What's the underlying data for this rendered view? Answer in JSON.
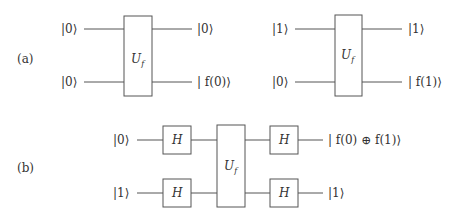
{
  "figure": {
    "parts": [
      {
        "label": "(a)",
        "circuits": [
          {
            "inputs": [
              "|0⟩",
              "|0⟩"
            ],
            "gate": {
              "symbol": "U",
              "subscript": "f"
            },
            "outputs": [
              "|0⟩",
              "| f(0)⟩"
            ]
          },
          {
            "inputs": [
              "|1⟩",
              "|0⟩"
            ],
            "gate": {
              "symbol": "U",
              "subscript": "f"
            },
            "outputs": [
              "|1⟩",
              "| f(1)⟩"
            ]
          }
        ]
      },
      {
        "label": "(b)",
        "circuit": {
          "inputs": [
            "|0⟩",
            "|1⟩"
          ],
          "pre_gates": [
            "H",
            "H"
          ],
          "gate": {
            "symbol": "U",
            "subscript": "f"
          },
          "post_gates": [
            "H",
            "H"
          ],
          "outputs": [
            "| f(0) ⊕ f(1)⟩",
            "|1⟩"
          ]
        }
      }
    ]
  },
  "colors": {
    "line": "#555555",
    "text": "#333333",
    "background": "#ffffff"
  }
}
